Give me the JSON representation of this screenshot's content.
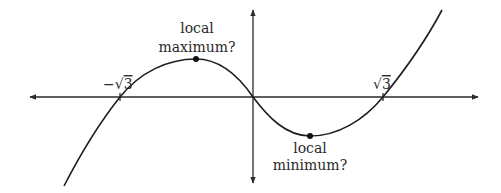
{
  "figure": {
    "colors": {
      "background": "#ffffff",
      "ink": "#1e1e1e"
    },
    "axes": {
      "x_axis": {
        "arrows": "both",
        "tick_labels": [
          "−√3",
          "√3"
        ]
      },
      "y_axis": {
        "arrows": "both"
      }
    },
    "roots": [
      "−√3",
      "0",
      "√3"
    ],
    "annotations": {
      "local_max": {
        "line1": "local",
        "line2": "maximum?"
      },
      "local_min": {
        "line1": "local",
        "line2": "minimum?"
      }
    },
    "tick_labels": {
      "neg_root": "−√",
      "neg_root_digit": "3",
      "pos_root": "√",
      "pos_root_digit": "3"
    }
  }
}
